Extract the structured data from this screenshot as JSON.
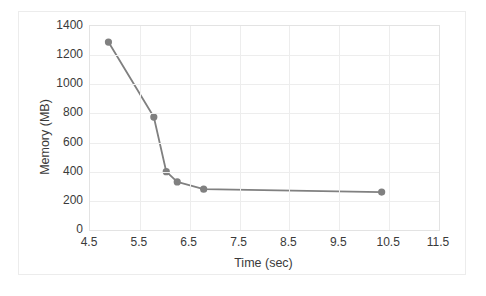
{
  "chart_data": {
    "type": "line",
    "title": "",
    "xlabel": "Time (sec)",
    "ylabel": "Memory (MB)",
    "xlim": [
      4.5,
      11.5
    ],
    "ylim": [
      0,
      1400
    ],
    "xticks": [
      "4.5",
      "5.5",
      "6.5",
      "7.5",
      "8.5",
      "9.5",
      "10.5",
      "11.5"
    ],
    "yticks": [
      "0",
      "200",
      "400",
      "600",
      "800",
      "1000",
      "1200",
      "1400"
    ],
    "grid": true,
    "legend": "none",
    "series": [
      {
        "name": "Memory",
        "color": "#808080",
        "marker": "circle",
        "x": [
          4.87,
          5.78,
          6.03,
          6.25,
          6.78,
          10.35
        ],
        "values": [
          1290,
          775,
          400,
          330,
          280,
          260
        ]
      }
    ]
  },
  "figure": {
    "background": "#ffffff",
    "border_color": "#ececec",
    "plot_border_color": "#e3e3e3",
    "gridline_color": "#ededed",
    "text_color": "#3a3a3a"
  }
}
